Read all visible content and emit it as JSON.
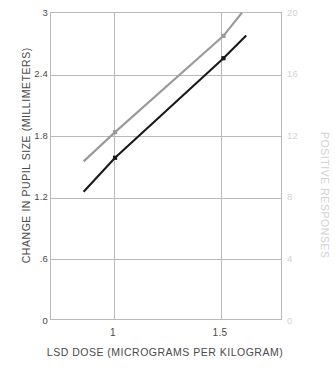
{
  "chart_data": {
    "type": "line",
    "title": "",
    "xlabel": "LSD DOSE (MICROGRAMS PER KILOGRAM)",
    "ylabel": "CHANGE IN PUPIL SIZE (MILLIMETERS)",
    "ylabel_right": "POSITIVE RESPONSES",
    "xlim": [
      0.7,
      1.77
    ],
    "ylim": [
      0,
      3
    ],
    "ylim_right": [
      0,
      20
    ],
    "grid": true,
    "legend_position": "none",
    "x_ticks": [
      "1",
      "1.5"
    ],
    "x_tick_values": [
      1,
      1.5
    ],
    "y_ticks_left": [
      "0",
      ".6",
      "1.2",
      "1.8",
      "2.4",
      "3"
    ],
    "y_tick_values_left": [
      0,
      0.6,
      1.2,
      1.8,
      2.4,
      3
    ],
    "y_ticks_right": [
      "0",
      "4",
      "8",
      "12",
      "16",
      "20"
    ],
    "y_tick_values_right": [
      0,
      4,
      8,
      12,
      16,
      20
    ],
    "colors": {
      "pupil_series": "#1a1a1a",
      "responses_series": "#9a9a9a",
      "grid": "#b9b9b9",
      "left_axis_text": "#4a4a4a",
      "right_axis_text": "#d2d2d2"
    },
    "series": [
      {
        "name": "CHANGE IN PUPIL SIZE (MILLIMETERS)",
        "axis": "left",
        "color": "#1a1a1a",
        "x": [
          0.855,
          1.0,
          1.5,
          1.605
        ],
        "values": [
          1.25,
          1.58,
          2.55,
          2.77
        ],
        "markers_at_x": [
          1.0,
          1.5
        ]
      },
      {
        "name": "POSITIVE RESPONSES",
        "axis": "right",
        "color": "#9a9a9a",
        "x": [
          0.855,
          1.0,
          1.5,
          1.585
        ],
        "values": [
          10.3,
          12.2,
          18.45,
          19.95
        ],
        "markers_at_x": [
          1.0,
          1.5
        ]
      }
    ]
  }
}
